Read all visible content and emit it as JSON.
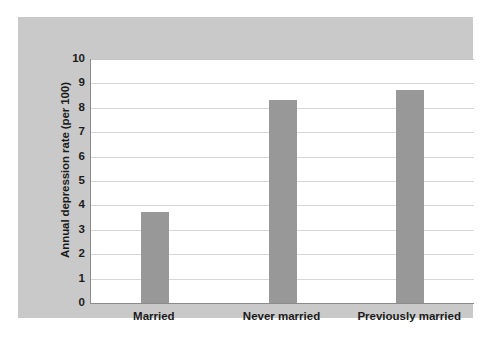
{
  "chart_data": {
    "type": "bar",
    "title": "",
    "subtitle": "",
    "xlabel": "",
    "ylabel": "Annual depression rate (per 100)",
    "categories": [
      "Married",
      "Never married",
      "Previously married"
    ],
    "values": [
      3.75,
      8.3,
      8.75
    ],
    "series": [
      {
        "name": "Annual depression rate (per 100)",
        "values": [
          3.75,
          8.3,
          8.75
        ]
      }
    ],
    "ylim": [
      0,
      10
    ],
    "y_ticks": [
      "0",
      "1",
      "2",
      "3",
      "4",
      "5",
      "6",
      "7",
      "8",
      "9",
      "10"
    ],
    "grid": true,
    "legend": null,
    "legend_position": "none",
    "annotations": [],
    "colors": {
      "bar_fill": "#989898",
      "plot_background": "#ffffff",
      "figure_background": "#c9c9c9",
      "page_background": "#ffffff",
      "gridline": "#d6d6d6",
      "axis_line": "#8a8a8a",
      "text": "#1b1b1b"
    }
  }
}
